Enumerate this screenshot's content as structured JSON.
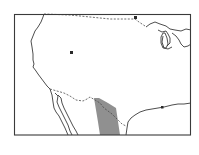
{
  "map": {
    "title": "",
    "region": "Contiguous United States and northern Mexico",
    "colors": {
      "frame": "#3a3a3a",
      "coastline": "#3a3a3a",
      "border": "#4a4a4a",
      "shaded_range": "#8a8a8a",
      "background": "#ffffff"
    },
    "features": [
      {
        "name": "frame",
        "type": "rectangle"
      },
      {
        "name": "pacific-coastline",
        "type": "line"
      },
      {
        "name": "great-lakes",
        "type": "outline"
      },
      {
        "name": "gulf-coastline",
        "type": "line"
      },
      {
        "name": "baja-california",
        "type": "outline"
      },
      {
        "name": "us-canada-border",
        "type": "dashed-line"
      },
      {
        "name": "us-mexico-border",
        "type": "dashed-line"
      },
      {
        "name": "great-salt-lake",
        "type": "marker"
      },
      {
        "name": "distribution-range",
        "type": "shaded-area",
        "location": "Texas / northeastern Mexico"
      }
    ]
  }
}
